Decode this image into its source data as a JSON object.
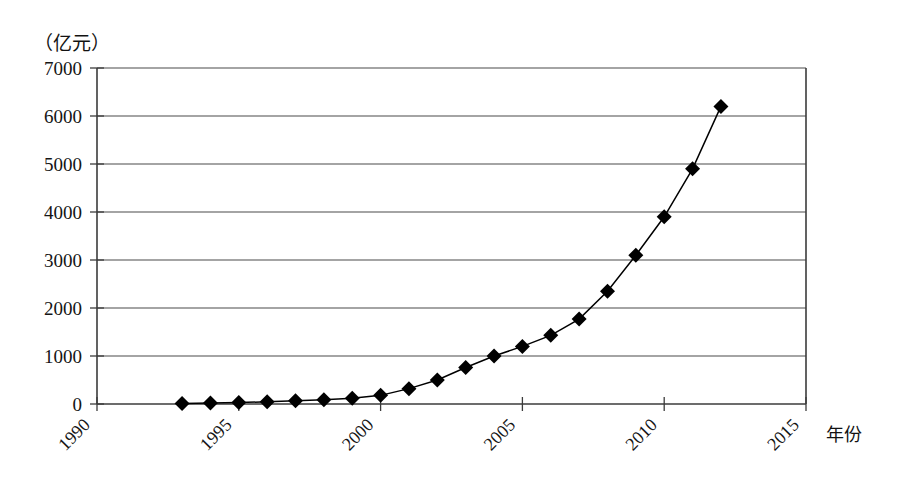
{
  "chart_data": {
    "type": "line",
    "title": "",
    "subtitle": "",
    "unit_label": "（亿元）",
    "xlabel": "年份",
    "ylabel": "",
    "xlim": [
      1990,
      2015
    ],
    "ylim": [
      0,
      7000
    ],
    "grid": true,
    "legend": null,
    "marker": "diamond",
    "marker_color": "#000000",
    "line_color": "#000000",
    "x_ticks": [
      1990,
      1995,
      2000,
      2005,
      2010,
      2015
    ],
    "x_tick_labels": [
      "1990",
      "1995",
      "2000",
      "2005",
      "2010",
      "2015"
    ],
    "x_tick_rotation": 45,
    "y_ticks": [
      0,
      1000,
      2000,
      3000,
      4000,
      5000,
      6000,
      7000
    ],
    "y_tick_labels": [
      "0",
      "1000",
      "2000",
      "3000",
      "4000",
      "5000",
      "6000",
      "7000"
    ],
    "series": [
      {
        "name": "",
        "x": [
          1993,
          1994,
          1995,
          1996,
          1997,
          1998,
          1999,
          2000,
          2001,
          2002,
          2003,
          2004,
          2005,
          2006,
          2007,
          2008,
          2009,
          2010,
          2011,
          2012
        ],
        "values": [
          10,
          20,
          30,
          45,
          70,
          90,
          120,
          180,
          320,
          500,
          760,
          1000,
          1200,
          1430,
          1770,
          2350,
          3100,
          3900,
          4900,
          6200
        ]
      }
    ]
  },
  "axes": {
    "y_axis_name": "unit-axis",
    "x_axis_name": "year-axis"
  }
}
